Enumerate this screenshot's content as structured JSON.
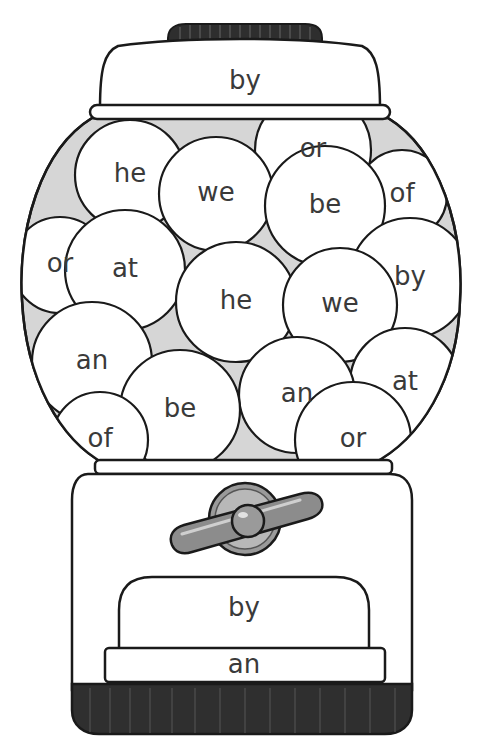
{
  "worksheet": {
    "title": "Gumball Machine Sight Words",
    "cap_word": "by",
    "chute_word": "by",
    "base_strip_word": "an",
    "gumballs": [
      {
        "word": "or",
        "cx": 313,
        "cy": 150,
        "r": 58
      },
      {
        "word": "of",
        "cx": 402,
        "cy": 195,
        "r": 45
      },
      {
        "word": "he",
        "cx": 130,
        "cy": 175,
        "r": 55
      },
      {
        "word": "we",
        "cx": 216,
        "cy": 194,
        "r": 57
      },
      {
        "word": "be",
        "cx": 325,
        "cy": 206,
        "r": 60
      },
      {
        "word": "or",
        "cx": 60,
        "cy": 265,
        "r": 48
      },
      {
        "word": "at",
        "cx": 125,
        "cy": 270,
        "r": 60
      },
      {
        "word": "by",
        "cx": 410,
        "cy": 278,
        "r": 60
      },
      {
        "word": "he",
        "cx": 236,
        "cy": 302,
        "r": 60
      },
      {
        "word": "we",
        "cx": 340,
        "cy": 305,
        "r": 57
      },
      {
        "word": "an",
        "cx": 92,
        "cy": 362,
        "r": 60
      },
      {
        "word": "at",
        "cx": 405,
        "cy": 383,
        "r": 55
      },
      {
        "word": "an",
        "cx": 297,
        "cy": 395,
        "r": 58
      },
      {
        "word": "be",
        "cx": 180,
        "cy": 410,
        "r": 60
      },
      {
        "word": "of",
        "cx": 100,
        "cy": 440,
        "r": 48
      },
      {
        "word": "or",
        "cx": 353,
        "cy": 440,
        "r": 58
      }
    ]
  },
  "colors": {
    "outline": "#1a1a1a",
    "fill": "#ffffff",
    "glass_shade": "#d6d6d6",
    "cap_knob": "#2e2e2e",
    "base_ring": "#2f2f2f",
    "crank": "#8c8c8c",
    "text": "#3a3a3a"
  }
}
